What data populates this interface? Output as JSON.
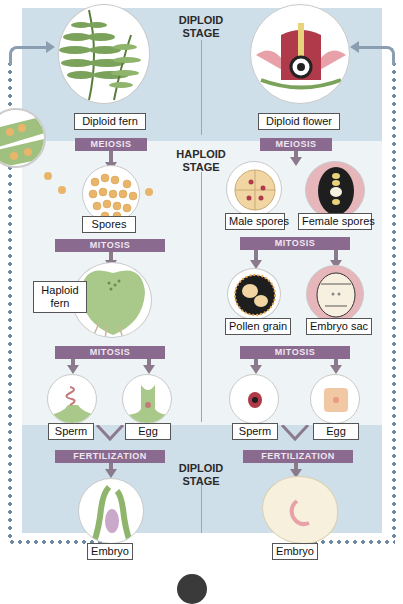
{
  "stages": {
    "top": "DIPLOID\nSTAGE",
    "top_line1": "DIPLOID",
    "top_line2": "STAGE",
    "middle_line1": "HAPLOID",
    "middle_line2": "STAGE",
    "bottom_line1": "DIPLOID",
    "bottom_line2": "STAGE"
  },
  "fern": {
    "diploid": "Diploid fern",
    "meiosis": "MEIOSIS",
    "spores": "Spores",
    "mitosis1": "MITOSIS",
    "haploid_line1": "Haploid",
    "haploid_line2": "fern",
    "mitosis2": "MITOSIS",
    "sperm": "Sperm",
    "egg": "Egg",
    "fertilization": "FERTILIZATION",
    "embryo": "Embryo"
  },
  "flower": {
    "diploid": "Diploid flower",
    "meiosis": "MEIOSIS",
    "male_spores": "Male spores",
    "female_spores": "Female spores",
    "mitosis1": "MITOSIS",
    "pollen": "Pollen grain",
    "embryo_sac": "Embryo sac",
    "mitosis2": "MITOSIS",
    "sperm": "Sperm",
    "egg": "Egg",
    "fertilization": "FERTILIZATION",
    "embryo": "Embryo"
  },
  "colors": {
    "diploid_band": "#cfdfe9",
    "haploid_band": "#eef3f6",
    "process_bar": "#8a6a8e",
    "arrow": "#8b7a8c",
    "cycle_dots": "#6f8aa0",
    "fern_green": "#7aa25a",
    "spore_orange": "#e9b56a"
  }
}
